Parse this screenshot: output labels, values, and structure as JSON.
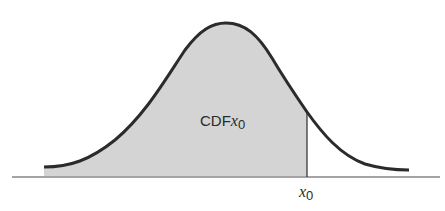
{
  "diagram": {
    "type": "normal-distribution-cdf",
    "shaded_region_label": {
      "prefix": "CDF",
      "var": "x",
      "sub": "0"
    },
    "axis_marker_label": {
      "var": "x",
      "sub": "0"
    },
    "colors": {
      "curve": "#2b2b2b",
      "shade": "#d4d4d4",
      "axis": "#4a4a4a",
      "background": "#ffffff"
    }
  }
}
